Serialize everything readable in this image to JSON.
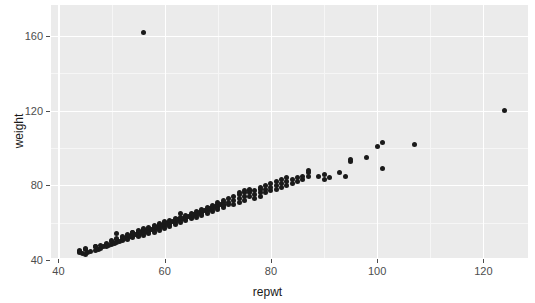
{
  "chart_data": {
    "type": "scatter",
    "title": "",
    "subtitle": "",
    "xlabel": "repwt",
    "ylabel": "weight",
    "xlim": [
      38.6,
      128.4
    ],
    "ylim": [
      41.1,
      176.6
    ],
    "xticks": [
      40,
      60,
      80,
      100,
      120
    ],
    "xticklabels": [
      "40",
      "60",
      "80",
      "100",
      "120"
    ],
    "yticks": [
      40,
      80,
      120,
      160
    ],
    "yticklabels": [
      "40",
      "80",
      "120",
      "160"
    ],
    "x_minor_ticks": [
      50,
      70,
      90,
      110
    ],
    "y_minor_ticks": [
      60,
      100,
      140
    ],
    "grid": true,
    "legend": false,
    "legend_position": "none",
    "n_points": 183,
    "point_color": "#1a1a1a",
    "point_size": 5,
    "panel_background": "#ebebeb",
    "grid_color": "#ffffff",
    "axis_text_color": "#4d4d4d",
    "axis_title_color": "#1a1a1a",
    "series": [
      {
        "name": "repwt vs weight",
        "points": [
          [
            41,
            40
          ],
          [
            44,
            44
          ],
          [
            44,
            44.5
          ],
          [
            44,
            45
          ],
          [
            44.5,
            43.5
          ],
          [
            45,
            43
          ],
          [
            45,
            45.5
          ],
          [
            45,
            46
          ],
          [
            45.5,
            44
          ],
          [
            46,
            44.5
          ],
          [
            47,
            45
          ],
          [
            47,
            47
          ],
          [
            47,
            47.5
          ],
          [
            47.5,
            45.5
          ],
          [
            48,
            46
          ],
          [
            48,
            48
          ],
          [
            48.5,
            47
          ],
          [
            49,
            47.5
          ],
          [
            49,
            48.5
          ],
          [
            49,
            49
          ],
          [
            49.5,
            48
          ],
          [
            50,
            48.5
          ],
          [
            50,
            50
          ],
          [
            50,
            50.5
          ],
          [
            50.5,
            49
          ],
          [
            51,
            49.5
          ],
          [
            51,
            51
          ],
          [
            51,
            51.5
          ],
          [
            51,
            54
          ],
          [
            51.5,
            50
          ],
          [
            52,
            50.5
          ],
          [
            52,
            51
          ],
          [
            52,
            52
          ],
          [
            52,
            52.5
          ],
          [
            52.5,
            51.5
          ],
          [
            53,
            51
          ],
          [
            53,
            52
          ],
          [
            53,
            53
          ],
          [
            53,
            53.5
          ],
          [
            53.5,
            52.5
          ],
          [
            54,
            52
          ],
          [
            54,
            53
          ],
          [
            54,
            54
          ],
          [
            54,
            54.5
          ],
          [
            54,
            55
          ],
          [
            54.5,
            53.5
          ],
          [
            55,
            52.5
          ],
          [
            55,
            53
          ],
          [
            55,
            54
          ],
          [
            55,
            55
          ],
          [
            55,
            55.5
          ],
          [
            55,
            56
          ],
          [
            55.5,
            54.5
          ],
          [
            56,
            53
          ],
          [
            56,
            54
          ],
          [
            56,
            55
          ],
          [
            56,
            56
          ],
          [
            56,
            56.5
          ],
          [
            56,
            57
          ],
          [
            56,
            162
          ],
          [
            56.5,
            55.5
          ],
          [
            57,
            54
          ],
          [
            57,
            55
          ],
          [
            57,
            56
          ],
          [
            57,
            57
          ],
          [
            57,
            57.5
          ],
          [
            57.5,
            56.5
          ],
          [
            58,
            55
          ],
          [
            58,
            56
          ],
          [
            58,
            57
          ],
          [
            58,
            58
          ],
          [
            58,
            58.5
          ],
          [
            58.5,
            57.5
          ],
          [
            59,
            56
          ],
          [
            59,
            57
          ],
          [
            59,
            58
          ],
          [
            59,
            59
          ],
          [
            59,
            59.5
          ],
          [
            59.5,
            58.5
          ],
          [
            60,
            57
          ],
          [
            60,
            58
          ],
          [
            60,
            59
          ],
          [
            60,
            60
          ],
          [
            60,
            60.5
          ],
          [
            60.5,
            59.5
          ],
          [
            61,
            58
          ],
          [
            61,
            59
          ],
          [
            61,
            60
          ],
          [
            61,
            61
          ],
          [
            61.5,
            60.5
          ],
          [
            62,
            59
          ],
          [
            62,
            60
          ],
          [
            62,
            61
          ],
          [
            62,
            62
          ],
          [
            62.5,
            61.5
          ],
          [
            63,
            60
          ],
          [
            63,
            61
          ],
          [
            63,
            62
          ],
          [
            63,
            63
          ],
          [
            63,
            65
          ],
          [
            63.5,
            62.5
          ],
          [
            64,
            61
          ],
          [
            64,
            62
          ],
          [
            64,
            63
          ],
          [
            64,
            64
          ],
          [
            64.5,
            63.5
          ],
          [
            65,
            62
          ],
          [
            65,
            63
          ],
          [
            65,
            64
          ],
          [
            65,
            65
          ],
          [
            65.5,
            64.5
          ],
          [
            66,
            63
          ],
          [
            66,
            64
          ],
          [
            66,
            65
          ],
          [
            66,
            66
          ],
          [
            66.5,
            65.5
          ],
          [
            67,
            64
          ],
          [
            67,
            65
          ],
          [
            67,
            66
          ],
          [
            67,
            67
          ],
          [
            67.5,
            66.5
          ],
          [
            68,
            65
          ],
          [
            68,
            66
          ],
          [
            68,
            67
          ],
          [
            68,
            68
          ],
          [
            68.5,
            67.5
          ],
          [
            69,
            66
          ],
          [
            69,
            67
          ],
          [
            69,
            68
          ],
          [
            69,
            69
          ],
          [
            69.5,
            68.5
          ],
          [
            70,
            67
          ],
          [
            70,
            68
          ],
          [
            70,
            69
          ],
          [
            70,
            70
          ],
          [
            70,
            71
          ],
          [
            70.5,
            69.5
          ],
          [
            71,
            68
          ],
          [
            71,
            69
          ],
          [
            71,
            70
          ],
          [
            71,
            71
          ],
          [
            71,
            72
          ],
          [
            72,
            70
          ],
          [
            72,
            71
          ],
          [
            72,
            73
          ],
          [
            73,
            70
          ],
          [
            73,
            72
          ],
          [
            73,
            74
          ],
          [
            74,
            71
          ],
          [
            74,
            73
          ],
          [
            74,
            75
          ],
          [
            74,
            76
          ],
          [
            75,
            72
          ],
          [
            75,
            74
          ],
          [
            75,
            76
          ],
          [
            75,
            77
          ],
          [
            76,
            74
          ],
          [
            76,
            76
          ],
          [
            76,
            77
          ],
          [
            76,
            78
          ],
          [
            77,
            73
          ],
          [
            77,
            75
          ],
          [
            77,
            77
          ],
          [
            78,
            74
          ],
          [
            78,
            76
          ],
          [
            78,
            78
          ],
          [
            78,
            79
          ],
          [
            79,
            76
          ],
          [
            79,
            78
          ],
          [
            79,
            80
          ],
          [
            80,
            77
          ],
          [
            80,
            79
          ],
          [
            80,
            81
          ],
          [
            81,
            78
          ],
          [
            81,
            80
          ],
          [
            81,
            82
          ],
          [
            82,
            79
          ],
          [
            82,
            81
          ],
          [
            82,
            83
          ],
          [
            83,
            80
          ],
          [
            83,
            82
          ],
          [
            83,
            84
          ],
          [
            84,
            81
          ],
          [
            84,
            83
          ],
          [
            85,
            82
          ],
          [
            85,
            84
          ],
          [
            86,
            83
          ],
          [
            86,
            85
          ],
          [
            87,
            85
          ],
          [
            87,
            87
          ],
          [
            87,
            88
          ],
          [
            89,
            85
          ],
          [
            90,
            83
          ],
          [
            90,
            86
          ],
          [
            91,
            84
          ],
          [
            93,
            87
          ],
          [
            94,
            85
          ],
          [
            95,
            93
          ],
          [
            95,
            94
          ],
          [
            98,
            95
          ],
          [
            100,
            101
          ],
          [
            101,
            103
          ],
          [
            101,
            89
          ],
          [
            107,
            102
          ],
          [
            124,
            120
          ]
        ]
      }
    ]
  },
  "axis": {
    "x_title": "repwt",
    "y_title": "weight"
  }
}
